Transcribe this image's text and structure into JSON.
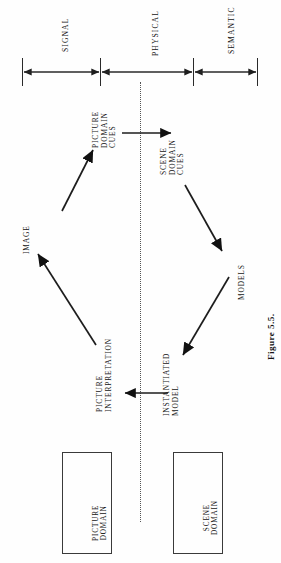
{
  "figure": {
    "caption": "Figure 5.5.",
    "orientation": "rotated-90-ccw"
  },
  "axis": {
    "segments": [
      {
        "label": "SIGNAL",
        "from_tick": 0,
        "to_tick": 1
      },
      {
        "label": "PHYSICAL",
        "from_tick": 1,
        "to_tick": 2
      },
      {
        "label": "SEMANTIC",
        "from_tick": 2,
        "to_tick": 3
      }
    ],
    "tick_count": 4
  },
  "nodes": {
    "picture_domain_cues": "PICTURE\nDOMAIN\nCUES",
    "scene_domain_cues": "SCENE\nDOMAIN\nCUES",
    "image": "IMAGE",
    "models": "MODELS",
    "picture_interpretation": "PICTURE\nINTERPRETATION",
    "instantiated_model": "INSTANTIATED\nMODEL"
  },
  "legend_boxes": [
    {
      "name": "picture-domain-box",
      "label": "PICTURE\nDOMAIN"
    },
    {
      "name": "scene-domain-box",
      "label": "SCENE\nDOMAIN"
    }
  ],
  "divider": {
    "name": "physical-boundary",
    "style": "dotted"
  },
  "colors": {
    "ink": "#141414",
    "rule": "#2b2b2b",
    "dotted": "#555555",
    "page": "#fefefe"
  }
}
